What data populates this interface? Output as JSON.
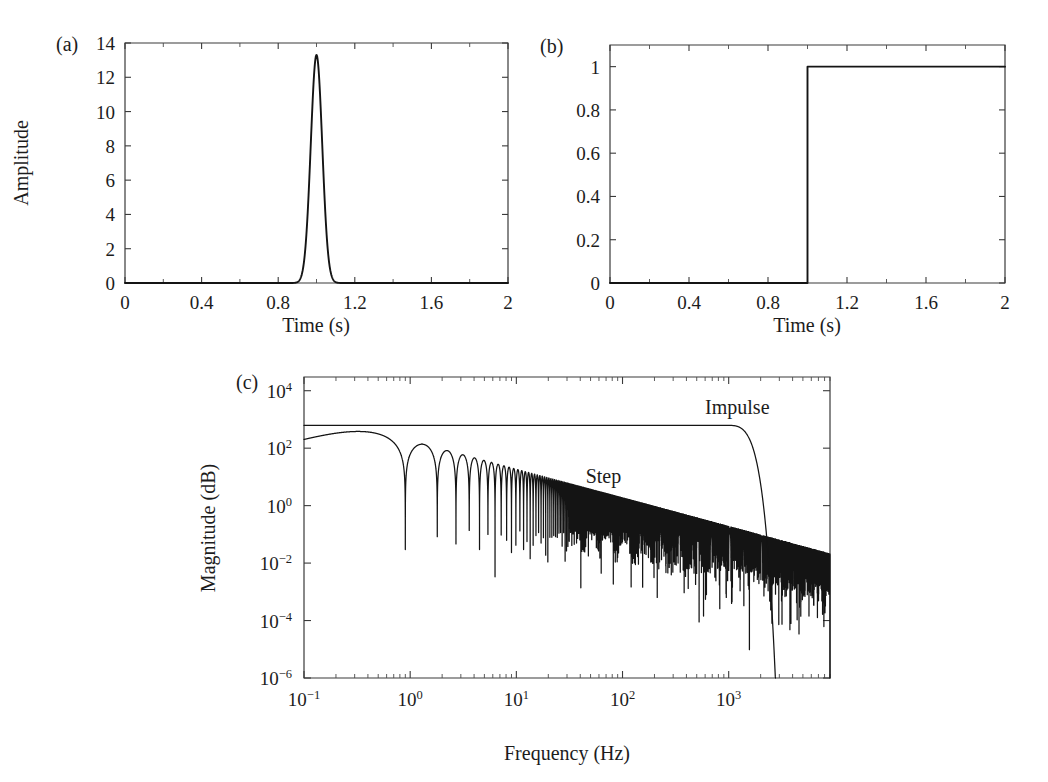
{
  "figure": {
    "background": "#ffffff",
    "ink_color": "#141414",
    "panels": [
      "a",
      "b",
      "c"
    ]
  },
  "panel_a": {
    "tag": "(a)",
    "xlabel": "Time (s)",
    "ylabel": "Amplitude"
  },
  "panel_b": {
    "tag": "(b)",
    "xlabel": "Time (s)",
    "ylabel": ""
  },
  "panel_c": {
    "tag": "(c)",
    "xlabel": "Frequency (Hz)",
    "ylabel": "Magnitude (dB)",
    "annotations": [
      {
        "text": "Impulse",
        "x_hz": 600,
        "y_mag": 1500
      },
      {
        "text": "Step",
        "x_hz": 45,
        "y_mag": 6
      }
    ]
  },
  "chart_data": [
    {
      "id": "panel-a",
      "type": "line",
      "title": "(a)",
      "xlabel": "Time (s)",
      "ylabel": "Amplitude",
      "xlim": [
        0,
        2
      ],
      "ylim": [
        0,
        14
      ],
      "xticks": [
        0,
        0.4,
        0.8,
        1.2,
        1.6,
        2
      ],
      "xticklabels": [
        "0",
        "0.4",
        "0.8",
        "1.2",
        "1.6",
        "2"
      ],
      "xticks_minor": [
        0.2,
        0.6,
        1.0,
        1.4,
        1.8
      ],
      "yticks": [
        0,
        2,
        4,
        6,
        8,
        10,
        12,
        14
      ],
      "yticklabels": [
        "0",
        "2",
        "4",
        "6",
        "8",
        "10",
        "12",
        "14"
      ],
      "grid": false,
      "legend": null,
      "series": [
        {
          "name": "Gaussian impulse",
          "description": "Narrow Gaussian pulse centred at t = 1.0 s",
          "peak_time_s": 1.0,
          "peak_amplitude": 13.3,
          "sigma_s": 0.03,
          "baseline": 0.0
        }
      ]
    },
    {
      "id": "panel-b",
      "type": "line",
      "title": "(b)",
      "xlabel": "Time (s)",
      "ylabel": "",
      "xlim": [
        0,
        2
      ],
      "ylim": [
        0,
        1.1
      ],
      "xticks": [
        0,
        0.4,
        0.8,
        1.2,
        1.6,
        2
      ],
      "xticklabels": [
        "0",
        "0.4",
        "0.8",
        "1.2",
        "1.6",
        "2"
      ],
      "xticks_minor": [
        0.2,
        0.6,
        1.0,
        1.4,
        1.8
      ],
      "yticks": [
        0,
        0.2,
        0.4,
        0.6,
        0.8,
        1
      ],
      "yticklabels": [
        "0",
        "0.2",
        "0.4",
        "0.6",
        "0.8",
        "1"
      ],
      "grid": false,
      "legend": null,
      "series": [
        {
          "name": "Unit step",
          "description": "Heaviside step rising from 0 to 1 at t = 1.0 s",
          "step_time_s": 1.0,
          "low_value": 0.0,
          "high_value": 1.0
        }
      ]
    },
    {
      "id": "panel-c",
      "type": "line",
      "title": "(c)",
      "xlabel": "Frequency (Hz)",
      "ylabel": "Magnitude (dB)",
      "xscale": "log",
      "yscale": "log",
      "xlim": [
        0.1,
        9000
      ],
      "ylim": [
        1e-06,
        30000.0
      ],
      "xticks": [
        0.1,
        1,
        10,
        100,
        1000
      ],
      "xticklabels": [
        "10⁻¹",
        "10⁰",
        "10¹",
        "10²",
        "10³"
      ],
      "yticks": [
        1e-06,
        0.0001,
        0.01,
        1,
        100,
        10000
      ],
      "yticklabels": [
        "10⁻⁶",
        "10⁻⁴",
        "10⁻²",
        "10⁰",
        "10²",
        "10⁴"
      ],
      "grid": false,
      "legend_position": "inline-annotations",
      "series": [
        {
          "name": "Impulse",
          "description": "Flat magnitude at ~620 held to ~1000 Hz then steep Gaussian roll-off past 2000 Hz",
          "plateau_magnitude": 620,
          "knee_hz": 1000,
          "rolloff_hz": 2600,
          "label": "Impulse"
        },
        {
          "name": "Step",
          "description": "Flat at ~620 to ~0.3 Hz then 1/f decay with sinc nulls; dense oscillation band",
          "plateau_magnitude": 620,
          "corner_hz": 0.3,
          "slope_per_decade": -1,
          "first_null_hz": 0.9,
          "label": "Step"
        }
      ]
    }
  ]
}
